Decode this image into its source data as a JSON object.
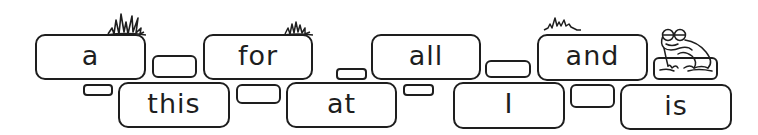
{
  "words": {
    "top": [
      "a",
      "for",
      "all",
      "and"
    ],
    "bottom": [
      "this",
      "at",
      "I",
      "is"
    ]
  },
  "colors": {
    "ink": "#1e1e1e",
    "background": "#ffffff"
  },
  "decorations": [
    "grass-tuft",
    "grass-tuft",
    "grass-tuft",
    "frog"
  ]
}
